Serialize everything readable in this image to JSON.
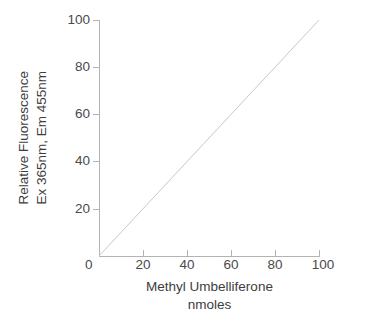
{
  "chart_data": {
    "type": "line",
    "title": "",
    "subtitle": "",
    "xlabel_lines": [
      "Methyl Umbelliferone",
      "nmoles"
    ],
    "ylabel_lines": [
      "Relative Fluorescence",
      "Ex 365nm, Em 455nm"
    ],
    "xlabel": "Methyl Umbelliferone nmoles",
    "ylabel": "Relative Fluorescence Ex 365nm, Em 455nm",
    "xlim": [
      0,
      100
    ],
    "ylim": [
      0,
      100
    ],
    "x_ticks": [
      0,
      20,
      40,
      60,
      80,
      100
    ],
    "y_ticks": [
      0,
      20,
      40,
      60,
      80,
      100
    ],
    "x_tick_labels": [
      "0",
      "20",
      "40",
      "60",
      "80",
      "100"
    ],
    "y_tick_labels": [
      "0",
      "20",
      "40",
      "60",
      "80",
      "100"
    ],
    "grid": false,
    "legend": false,
    "legend_position": "none",
    "series": [
      {
        "name": "standard curve",
        "x": [
          0,
          100
        ],
        "values": [
          0,
          100
        ],
        "color": "#c8c8c8",
        "style": "solid",
        "markers": false
      }
    ],
    "axis_color": "#b3b3b3",
    "text_color": "#3d3d3d",
    "background": "#ffffff"
  },
  "axis": {
    "y_labels": [
      {
        "text": "100",
        "value": 100
      },
      {
        "text": "80",
        "value": 80
      },
      {
        "text": "60",
        "value": 60
      },
      {
        "text": "40",
        "value": 40
      },
      {
        "text": "20",
        "value": 20
      }
    ],
    "x_labels": [
      {
        "text": "20",
        "value": 20
      },
      {
        "text": "40",
        "value": 40
      },
      {
        "text": "60",
        "value": 60
      },
      {
        "text": "80",
        "value": 80
      },
      {
        "text": "100",
        "value": 100
      }
    ],
    "origin_label": "0"
  },
  "titles": {
    "y_line1": "Relative Fluorescence",
    "y_line2": "Ex 365nm, Em 455nm",
    "x_line1": "Methyl Umbelliferone",
    "x_line2": "nmoles"
  }
}
